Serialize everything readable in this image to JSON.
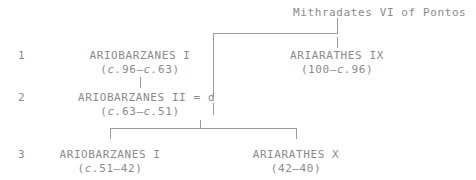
{
  "diagram": {
    "title": "Mithradates VI of Pontos",
    "rows": [
      {
        "number": "1",
        "left": {
          "name": "ARIOBARZANES I",
          "dates": "(c.96–c.63)"
        },
        "right": {
          "name": "ARIARATHES IX",
          "dates": "(100–c.96)"
        }
      },
      {
        "number": "2",
        "left": {
          "name": "ARIOBARZANES II = d",
          "dates": "(c.63–c.51)"
        },
        "right": {
          "name": "",
          "dates": ""
        }
      },
      {
        "number": "3",
        "left": {
          "name": "ARIOBARZANES I",
          "dates": "(c.51–42)"
        },
        "right": {
          "name": "ARIARATHES X",
          "dates": "(42–40)"
        }
      }
    ],
    "colors": {
      "text": "#8a8a8a",
      "rule": "#9a9a9a",
      "background": "#ffffff"
    }
  }
}
